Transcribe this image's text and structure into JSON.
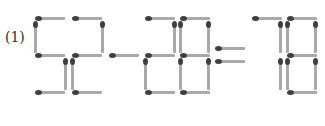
{
  "label": "(1)",
  "equation": "52-28=78",
  "colors": {
    "stick": "#a9a9a9",
    "head": "#3f3f3f",
    "background": "#ffffff"
  },
  "glyphs": [
    {
      "char": "5",
      "matches": [
        {
          "o": "h",
          "x": 35,
          "y": 16,
          "len": 30
        },
        {
          "o": "v",
          "x": 33,
          "y": 21,
          "len": 32
        },
        {
          "o": "h",
          "x": 35,
          "y": 53,
          "len": 30
        },
        {
          "o": "v",
          "x": 63,
          "y": 58,
          "len": 32
        },
        {
          "o": "h",
          "x": 35,
          "y": 90,
          "len": 30
        }
      ]
    },
    {
      "char": "2",
      "matches": [
        {
          "o": "h",
          "x": 72,
          "y": 16,
          "len": 30
        },
        {
          "o": "v",
          "x": 100,
          "y": 21,
          "len": 32
        },
        {
          "o": "h",
          "x": 72,
          "y": 53,
          "len": 30
        },
        {
          "o": "v",
          "x": 70,
          "y": 58,
          "len": 32
        },
        {
          "o": "h",
          "x": 72,
          "y": 90,
          "len": 30
        }
      ]
    },
    {
      "char": "-",
      "matches": [
        {
          "o": "h",
          "x": 109,
          "y": 53,
          "len": 30
        }
      ]
    },
    {
      "char": "2",
      "matches": [
        {
          "o": "h",
          "x": 145,
          "y": 16,
          "len": 30
        },
        {
          "o": "v",
          "x": 172,
          "y": 21,
          "len": 32
        },
        {
          "o": "h",
          "x": 145,
          "y": 53,
          "len": 30
        },
        {
          "o": "v",
          "x": 143,
          "y": 58,
          "len": 32
        },
        {
          "o": "h",
          "x": 145,
          "y": 90,
          "len": 30
        }
      ]
    },
    {
      "char": "8",
      "matches": [
        {
          "o": "h",
          "x": 180,
          "y": 16,
          "len": 30
        },
        {
          "o": "v",
          "x": 178,
          "y": 21,
          "len": 32
        },
        {
          "o": "v",
          "x": 206,
          "y": 21,
          "len": 32
        },
        {
          "o": "h",
          "x": 180,
          "y": 53,
          "len": 30
        },
        {
          "o": "v",
          "x": 178,
          "y": 58,
          "len": 32
        },
        {
          "o": "v",
          "x": 206,
          "y": 58,
          "len": 32
        },
        {
          "o": "h",
          "x": 180,
          "y": 90,
          "len": 30
        }
      ]
    },
    {
      "char": "=",
      "matches": [
        {
          "o": "h",
          "x": 215,
          "y": 46,
          "len": 30
        },
        {
          "o": "h",
          "x": 215,
          "y": 59,
          "len": 30
        }
      ]
    },
    {
      "char": "7",
      "matches": [
        {
          "o": "h",
          "x": 252,
          "y": 16,
          "len": 30
        },
        {
          "o": "v",
          "x": 278,
          "y": 21,
          "len": 32
        },
        {
          "o": "v",
          "x": 278,
          "y": 58,
          "len": 32
        }
      ]
    },
    {
      "char": "8",
      "matches": [
        {
          "o": "h",
          "x": 287,
          "y": 16,
          "len": 30
        },
        {
          "o": "v",
          "x": 285,
          "y": 21,
          "len": 32
        },
        {
          "o": "v",
          "x": 313,
          "y": 21,
          "len": 32
        },
        {
          "o": "h",
          "x": 287,
          "y": 53,
          "len": 30
        },
        {
          "o": "v",
          "x": 285,
          "y": 58,
          "len": 32
        },
        {
          "o": "v",
          "x": 313,
          "y": 58,
          "len": 32
        },
        {
          "o": "h",
          "x": 287,
          "y": 90,
          "len": 30
        }
      ]
    }
  ]
}
